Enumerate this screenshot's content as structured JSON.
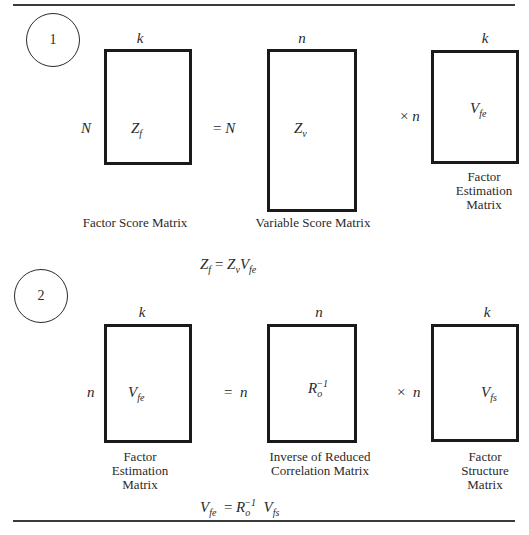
{
  "panel1": {
    "number": "1",
    "matrices": [
      {
        "id": "Zf",
        "symbol": "Z",
        "subscript": "f",
        "superscript": "",
        "cols": "k",
        "rows": "N",
        "caption_lines": [
          "Factor Score Matrix"
        ]
      },
      {
        "id": "Zv",
        "symbol": "Z",
        "subscript": "v",
        "superscript": "",
        "cols": "n",
        "rows": "N",
        "caption_lines": [
          "Variable Score Matrix"
        ]
      },
      {
        "id": "Vfe",
        "symbol": "V",
        "subscript": "fe",
        "superscript": "",
        "cols": "k",
        "rows": "n",
        "caption_lines": [
          "Factor",
          "Estimation",
          "Matrix"
        ]
      }
    ],
    "operators": {
      "equals": "=",
      "times": "×"
    },
    "equation": {
      "lhs": "Z",
      "lhs_sub": "f",
      "eq": "=",
      "t1": "Z",
      "t1_sub": "v",
      "t2": "V",
      "t2_sub": "fe"
    }
  },
  "panel2": {
    "number": "2",
    "matrices": [
      {
        "id": "Vfe",
        "symbol": "V",
        "subscript": "fe",
        "superscript": "",
        "cols": "k",
        "rows": "n",
        "caption_lines": [
          "Factor",
          "Estimation",
          "Matrix"
        ]
      },
      {
        "id": "Ro_inv",
        "symbol": "R",
        "subscript": "o",
        "superscript": "−1",
        "cols": "n",
        "rows": "n",
        "caption_lines": [
          "Inverse of Reduced",
          "Correlation Matrix"
        ]
      },
      {
        "id": "Vfs",
        "symbol": "V",
        "subscript": "fs",
        "superscript": "",
        "cols": "k",
        "rows": "n",
        "caption_lines": [
          "Factor",
          "Structure",
          "Matrix"
        ]
      }
    ],
    "operators": {
      "equals": "=",
      "times": "×"
    },
    "equation": {
      "lhs": "V",
      "lhs_sub": "fe",
      "eq": "=",
      "t1": "R",
      "t1_sub": "o",
      "t1_sup": "−1",
      "t2": "V",
      "t2_sub": "fs"
    }
  }
}
